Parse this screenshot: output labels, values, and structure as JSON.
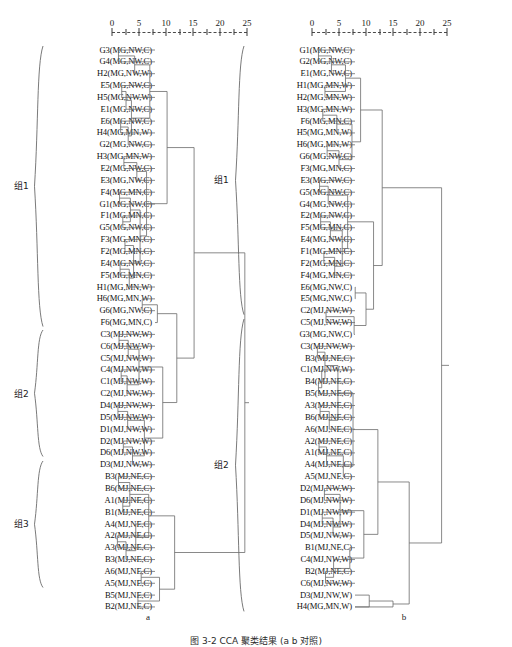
{
  "figure": {
    "caption": "图 3-2   CCA 聚类结果 (a      b    对照)",
    "panels": [
      {
        "id": "a",
        "sub_caption": "a",
        "axis": {
          "ticks": [
            0,
            5,
            10,
            15,
            20,
            25
          ],
          "tick_labels": [
            "0",
            "5",
            "10",
            "15",
            "20",
            "25"
          ]
        },
        "groups": [
          {
            "name": "组1",
            "first_leaf": 0,
            "last_leaf": 23
          },
          {
            "name": "组2",
            "first_leaf": 24,
            "last_leaf": 34
          },
          {
            "name": "组3",
            "first_leaf": 35,
            "last_leaf": 45
          }
        ],
        "leaves": [
          "G3(MG,NW,C)",
          "G4(MG,NW,C)",
          "H2(MG,NW,W)",
          "E5(MG,NW,C)",
          "H5(MG,NW,W)",
          "E1(MG,NW,C)",
          "E6(MG,NW,C)",
          "H4(MG,MN,W)",
          "G2(MG,NW,C)",
          "H3(MG,MN,W)",
          "E2(MG,NW,C)",
          "E3(MG,NW,C)",
          "F4(MG,MN,C)",
          "G1(MG,NW,C)",
          "F1(MG,MN,C)",
          "G5(MG,NW,C)",
          "F3(MG,MN,C)",
          "F2(MG,MN,C)",
          "E4(MG,NW,C)",
          "F5(MG,MN,C)",
          "H1(MG,MN,W)",
          "H6(MG,MN,W)",
          "G6(MG,NW,C)",
          "F6(MG,MN,C)",
          "C3(MJ,NW,W)",
          "C6(MJ,NW,W)",
          "C5(MJ,NW,W)",
          "C4(MJ,NW,W)",
          "C1(MJ,NW,W)",
          "C2(MJ,NW,W)",
          "D4(MJ,NW,W)",
          "D5(MJ,NW,W)",
          "D1(MJ,NW,W)",
          "D2(MJ,NW,W)",
          "D6(MJ,NW,W)",
          "D3(MJ,NW,W)",
          "B3(MJ,NE,C)",
          "B6(MJ,NE,C)",
          "A1(MJ,NE,C)",
          "B1(MJ,NE,C)",
          "A4(MJ,NE,C)",
          "A2(MJ,NE,C)",
          "A3(MJ,NE,C)",
          "B3(MJ,NE,C)",
          "A6(MJ,NE,C)",
          "A5(MJ,NE,C)",
          "B5(MJ,NE,C)",
          "B2(MJ,NE,C)"
        ]
      },
      {
        "id": "b",
        "sub_caption": "b",
        "axis": {
          "ticks": [
            0,
            5,
            10,
            15,
            20,
            25
          ],
          "tick_labels": [
            "0",
            "5",
            "10",
            "15",
            "20",
            "25"
          ]
        },
        "groups": [
          {
            "name": "组1",
            "first_leaf": 0,
            "last_leaf": 22
          },
          {
            "name": "组2",
            "first_leaf": 23,
            "last_leaf": 47
          }
        ],
        "leaves": [
          "G1(MG,NW,C)",
          "G2(MG,NW,C)",
          "E1(MG,NW,C)",
          "H1(MG,MN,W)",
          "H2(MG,MN,W)",
          "H3(MG,MN,W)",
          "F6(MG,MN,C)",
          "H5(MG,MN,W)",
          "H6(MG,MN,W)",
          "G6(MG,NW,C)",
          "F3(MG,MN,C)",
          "E3(MG,NW,C)",
          "G5(MG,NW,C)",
          "G4(MG,NW,C)",
          "E2(MG,NW,C)",
          "F5(MG,MN,C)",
          "E4(MG,NW,C)",
          "F1(MG,MN,C)",
          "F2(MG,MN,C)",
          "F4(MG,MN,C)",
          "E6(MG,NW,C)",
          "E5(MG,NW,C)",
          "C2(MJ,NW,W)",
          "C5(MJ,NW,W)",
          "G3(MG,NW,C)",
          "C3(MJ,NW,W)",
          "B3(MJ,NE,C)",
          "C1(MJ,NW,W)",
          "B4(MJ,NE,C)",
          "B5(MJ,NE,C)",
          "A3(MJ,NE,C)",
          "B6(MJ,NE,C)",
          "A6(MJ,NE,C)",
          "A2(MJ,NE,C)",
          "A1(MJ,NE,C)",
          "A4(MJ,NE,C)",
          "A5(MJ,NE,C)",
          "D2(MJ,NW,W)",
          "D6(MJ,NW,W)",
          "D1(MJ,NW,W)",
          "D4(MJ,NW,W)",
          "D5(MJ,NW,W)",
          "B1(MJ,NE,C)",
          "C4(MJ,NW,W)",
          "B2(MJ,NE,C)",
          "C6(MJ,NW,W)",
          "D3(MJ,NW,W)",
          "H4(MG,MN,W)"
        ]
      }
    ]
  }
}
